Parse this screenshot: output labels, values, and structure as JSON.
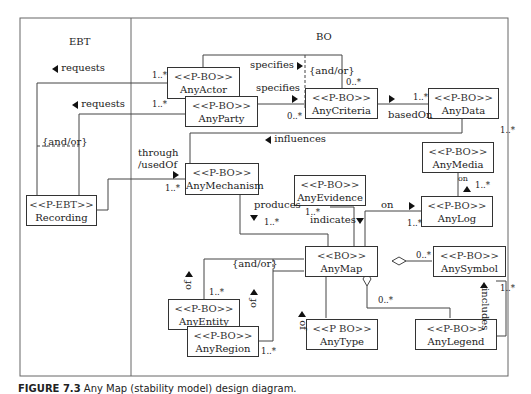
{
  "diagram": {
    "regions": {
      "ebt": "EBT",
      "bo": "BO"
    },
    "classes": {
      "any_actor": {
        "stereotype": "<<P-BO>>",
        "name": "AnyActor"
      },
      "any_party": {
        "stereotype": "<<P-BO>>",
        "name": "AnyParty"
      },
      "any_criteria": {
        "stereotype": "<<P-BO>>",
        "name": "AnyCriteria"
      },
      "any_data": {
        "stereotype": "<<P-BO>>",
        "name": "AnyData"
      },
      "recording": {
        "stereotype": "<<P-EBT>>",
        "name": "Recording"
      },
      "any_mechanism": {
        "stereotype": "<<P-BO>>",
        "name": "AnyMechanism"
      },
      "any_media": {
        "stereotype": "<<P-BO>>",
        "name": "AnyMedia"
      },
      "any_evidence": {
        "stereotype": "<<P-BO>>",
        "name": "AnyEvidence"
      },
      "any_log": {
        "stereotype": "<<P-BO>>",
        "name": "AnyLog"
      },
      "any_map": {
        "stereotype": "<<BO>>",
        "name": "AnyMap"
      },
      "any_symbol": {
        "stereotype": "<<P-BO>>",
        "name": "AnySymbol"
      },
      "any_entity": {
        "stereotype": "<<P-BO>>",
        "name": "AnyEntity"
      },
      "any_region": {
        "stereotype": "<<P-BO>>",
        "name": "AnyRegion"
      },
      "any_type": {
        "stereotype": "<<P BO>>",
        "name": "AnyType"
      },
      "any_legend": {
        "stereotype": "<<P-BO>>",
        "name": "AnyLegend"
      }
    },
    "labels": {
      "requests_1": "requests",
      "requests_2": "requests",
      "and_or_ebt": "{and/or}",
      "through_usedof_1": "through",
      "through_usedof_2": "/usedOf",
      "specifies_1": "specifies",
      "specifies_2": "specifies",
      "and_or_criteria": "{and/or}",
      "based_on": "basedOn",
      "influences": "influences",
      "on_media": "on",
      "on_log": "on",
      "produces": "produces",
      "indicates": "indicates",
      "and_or_map": "{and/or}",
      "of_entity": "of",
      "of_region": "of",
      "of_type": "of",
      "includes": "includes"
    },
    "multiplicities": {
      "actor_requests": "1..*",
      "party_requests": "1..*",
      "criteria_top": "0..*",
      "criteria_left": "0..*",
      "data_basedon": "1..*",
      "data_influences": "1..*",
      "mechanism_through": "1..*",
      "media_log": "1..*",
      "evidence": "1..*",
      "produces": "1..*",
      "log_on": "1..*",
      "symbol_map": "0..*",
      "legend_map": "0..*",
      "symbol_legend": "1..*",
      "entity": "1..*",
      "region": "1..*"
    }
  },
  "caption": {
    "figure_label": "FIGURE 7.3",
    "text": "Any Map (stability model) design diagram."
  }
}
